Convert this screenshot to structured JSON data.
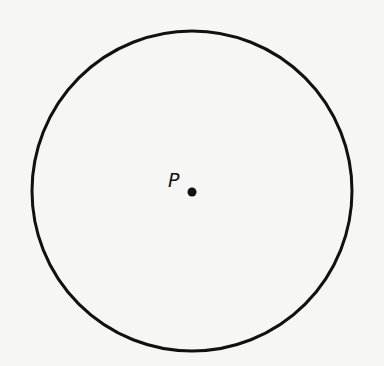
{
  "diagram": {
    "background": "#f6f6f4",
    "stroke_color": "#111111",
    "circle": {
      "cx": 192,
      "cy": 191,
      "r": 160,
      "stroke_width": 3
    },
    "point": {
      "label": "P",
      "cx": 192,
      "cy": 192,
      "r": 4.5,
      "label_x": 168,
      "label_y": 187
    }
  }
}
